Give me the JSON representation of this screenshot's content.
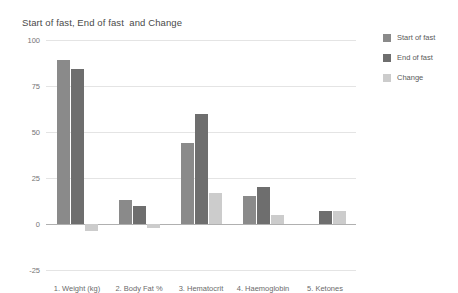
{
  "chart_data": {
    "type": "bar",
    "title": "Start of fast, End of fast  and Change",
    "xlabel": "",
    "ylabel": "",
    "ylim": [
      -25,
      100
    ],
    "yticks": [
      "100",
      "75",
      "50",
      "25",
      "0",
      "-25"
    ],
    "ytick_values": [
      100,
      75,
      50,
      25,
      0,
      -25
    ],
    "grid": true,
    "legend_position": "right",
    "categories": [
      "1. Weight (kg)",
      "2. Body Fat %",
      "3. Hematocrit",
      "4. Haemoglobin",
      "5. Ketones"
    ],
    "series": [
      {
        "name": "Start of fast",
        "color": "#8a8a8a",
        "values": [
          89,
          13,
          44,
          15,
          0
        ]
      },
      {
        "name": "End of fast",
        "color": "#6e6e6e",
        "values": [
          84,
          10,
          60,
          20,
          7
        ]
      },
      {
        "name": "Change",
        "color": "#cccccc",
        "values": [
          -4,
          -2,
          17,
          5,
          7
        ]
      }
    ]
  },
  "colors": {
    "background": "#ffffff",
    "gridline": "#e4e4e4",
    "axis": "#b0b0b0",
    "title_text": "#4a4a4a",
    "tick_text": "#757575",
    "series_1": "#8a8a8a",
    "series_2": "#6e6e6e",
    "series_3": "#cccccc"
  }
}
